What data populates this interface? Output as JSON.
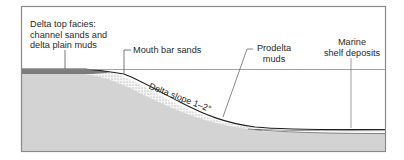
{
  "diagram": {
    "type": "cross-section",
    "labels": {
      "delta_top": [
        "Delta top facies:",
        "channel sands and",
        "delta plain muds"
      ],
      "mouth_bar": "Mouth bar sands",
      "prodelta": [
        "Prodelta",
        "muds"
      ],
      "marine_shelf": [
        "Marine",
        "shelf deposits"
      ],
      "delta_slope": "Delta slope 1–2°"
    },
    "colors": {
      "frame": "#8a8a8a",
      "substrate": "#d2d2d2",
      "delta_top_band": "#7a7a7a",
      "delta_top_edge": "#4a4a4a",
      "slope_line": "#222222",
      "stipple": "#9a9a9a",
      "water": "#ffffff",
      "leader": "#555555"
    }
  }
}
